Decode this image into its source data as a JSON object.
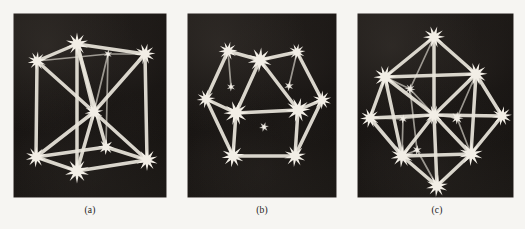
{
  "figure": {
    "background_color": "#f6f5f2",
    "panel_background_color": "#171412",
    "rod_color": "#e8e4da",
    "node_color": "#f2eee6",
    "panels": [
      {
        "id": "panel-a",
        "caption": "(a)",
        "model_name": "cube lattice model",
        "x": 14,
        "y": 14,
        "width": 152,
        "height": 183,
        "node_count": 9,
        "rod_count": 20
      },
      {
        "id": "panel-b",
        "caption": "(b)",
        "model_name": "hexagonal lattice model",
        "x": 188,
        "y": 14,
        "width": 148,
        "height": 183,
        "node_count": 12,
        "rod_count": 16
      },
      {
        "id": "panel-c",
        "caption": "(c)",
        "model_name": "face-centered cubic lattice model",
        "x": 358,
        "y": 14,
        "width": 155,
        "height": 183,
        "node_count": 13,
        "rod_count": 32
      }
    ]
  },
  "chart_data": {
    "type": "scatter",
    "title": "",
    "xlabel": "",
    "ylabel": "",
    "panels": [
      {
        "label": "(a)",
        "name": "cube lattice model",
        "xlim": [
          0,
          152
        ],
        "ylim": [
          0,
          183
        ],
        "nodes": [
          {
            "id": "n0",
            "x": 63,
            "y": 30,
            "r": 11.5
          },
          {
            "id": "n1",
            "x": 23,
            "y": 47,
            "r": 9.5
          },
          {
            "id": "n2",
            "x": 131,
            "y": 40,
            "r": 10.5
          },
          {
            "id": "n3",
            "x": 94,
            "y": 40,
            "r": 4.5
          },
          {
            "id": "n4",
            "x": 80,
            "y": 98,
            "r": 9.5
          },
          {
            "id": "n5",
            "x": 22,
            "y": 143,
            "r": 10.5
          },
          {
            "id": "n6",
            "x": 63,
            "y": 157,
            "r": 12.5
          },
          {
            "id": "n7",
            "x": 133,
            "y": 146,
            "r": 11.0
          },
          {
            "id": "n8",
            "x": 92,
            "y": 133,
            "r": 8.0
          }
        ],
        "rods": [
          [
            "n1",
            "n0"
          ],
          [
            "n0",
            "n2"
          ],
          [
            "n1",
            "n3"
          ],
          [
            "n3",
            "n2"
          ],
          [
            "n1",
            "n5"
          ],
          [
            "n0",
            "n6"
          ],
          [
            "n2",
            "n7"
          ],
          [
            "n3",
            "n8"
          ],
          [
            "n5",
            "n6"
          ],
          [
            "n6",
            "n7"
          ],
          [
            "n5",
            "n8"
          ],
          [
            "n8",
            "n7"
          ],
          [
            "n0",
            "n4"
          ],
          [
            "n4",
            "n5"
          ],
          [
            "n4",
            "n7"
          ],
          [
            "n4",
            "n6"
          ],
          [
            "n1",
            "n4"
          ],
          [
            "n2",
            "n4"
          ],
          [
            "n0",
            "n8"
          ],
          [
            "n3",
            "n4"
          ]
        ]
      },
      {
        "label": "(b)",
        "name": "hexagonal lattice model",
        "xlim": [
          0,
          148
        ],
        "ylim": [
          0,
          183
        ],
        "nodes": [
          {
            "id": "m0",
            "x": 72,
            "y": 46,
            "r": 12.5
          },
          {
            "id": "m1",
            "x": 40,
            "y": 37,
            "r": 9.5
          },
          {
            "id": "m2",
            "x": 109,
            "y": 38,
            "r": 8.5
          },
          {
            "id": "m3",
            "x": 18,
            "y": 85,
            "r": 9.5
          },
          {
            "id": "m4",
            "x": 48,
            "y": 99,
            "r": 12.5
          },
          {
            "id": "m5",
            "x": 110,
            "y": 96,
            "r": 12.5
          },
          {
            "id": "m6",
            "x": 134,
            "y": 86,
            "r": 9.5
          },
          {
            "id": "m7",
            "x": 45,
            "y": 142,
            "r": 11.5
          },
          {
            "id": "m8",
            "x": 107,
            "y": 142,
            "r": 11.0
          },
          {
            "id": "m9",
            "x": 43,
            "y": 73,
            "r": 4.5
          },
          {
            "id": "m10",
            "x": 101,
            "y": 72,
            "r": 5.0
          },
          {
            "id": "m11",
            "x": 76,
            "y": 113,
            "r": 5.0
          }
        ],
        "rods": [
          [
            "m0",
            "m4"
          ],
          [
            "m0",
            "m5"
          ],
          [
            "m4",
            "m5"
          ],
          [
            "m4",
            "m7"
          ],
          [
            "m5",
            "m8"
          ],
          [
            "m7",
            "m8"
          ],
          [
            "m1",
            "m3"
          ],
          [
            "m3",
            "m4"
          ],
          [
            "m1",
            "m0"
          ],
          [
            "m2",
            "m6"
          ],
          [
            "m6",
            "m5"
          ],
          [
            "m2",
            "m0"
          ],
          [
            "m3",
            "m7"
          ],
          [
            "m6",
            "m8"
          ],
          [
            "m1",
            "m9"
          ],
          [
            "m2",
            "m10"
          ]
        ]
      },
      {
        "label": "(c)",
        "name": "face-centered cubic lattice model",
        "xlim": [
          0,
          155
        ],
        "ylim": [
          0,
          183
        ],
        "nodes": [
          {
            "id": "p0",
            "x": 76,
            "y": 23,
            "r": 11.0
          },
          {
            "id": "p1",
            "x": 27,
            "y": 63,
            "r": 11.5
          },
          {
            "id": "p2",
            "x": 118,
            "y": 60,
            "r": 11.5
          },
          {
            "id": "p3",
            "x": 12,
            "y": 104,
            "r": 10.0
          },
          {
            "id": "p4",
            "x": 144,
            "y": 102,
            "r": 10.0
          },
          {
            "id": "p5",
            "x": 44,
            "y": 142,
            "r": 11.5
          },
          {
            "id": "p6",
            "x": 113,
            "y": 140,
            "r": 12.0
          },
          {
            "id": "p7",
            "x": 79,
            "y": 172,
            "r": 11.0
          },
          {
            "id": "p8",
            "x": 76,
            "y": 101,
            "r": 10.0
          },
          {
            "id": "p9",
            "x": 52,
            "y": 75,
            "r": 5.5
          },
          {
            "id": "p10",
            "x": 99,
            "y": 104,
            "r": 6.5
          },
          {
            "id": "p11",
            "x": 45,
            "y": 105,
            "r": 4.5
          },
          {
            "id": "p12",
            "x": 59,
            "y": 136,
            "r": 5.0
          }
        ],
        "rods": [
          [
            "p0",
            "p1"
          ],
          [
            "p0",
            "p2"
          ],
          [
            "p1",
            "p3"
          ],
          [
            "p2",
            "p4"
          ],
          [
            "p3",
            "p5"
          ],
          [
            "p4",
            "p6"
          ],
          [
            "p5",
            "p7"
          ],
          [
            "p6",
            "p7"
          ],
          [
            "p1",
            "p2"
          ],
          [
            "p5",
            "p6"
          ],
          [
            "p1",
            "p5"
          ],
          [
            "p2",
            "p6"
          ],
          [
            "p0",
            "p8"
          ],
          [
            "p8",
            "p7"
          ],
          [
            "p3",
            "p8"
          ],
          [
            "p8",
            "p4"
          ],
          [
            "p1",
            "p8"
          ],
          [
            "p2",
            "p8"
          ],
          [
            "p5",
            "p8"
          ],
          [
            "p6",
            "p8"
          ],
          [
            "p0",
            "p9"
          ],
          [
            "p9",
            "p12"
          ],
          [
            "p9",
            "p1"
          ],
          [
            "p9",
            "p8"
          ],
          [
            "p10",
            "p2"
          ],
          [
            "p10",
            "p6"
          ],
          [
            "p10",
            "p8"
          ],
          [
            "p11",
            "p3"
          ],
          [
            "p11",
            "p5"
          ],
          [
            "p12",
            "p5"
          ],
          [
            "p12",
            "p7"
          ],
          [
            "p11",
            "p8"
          ]
        ]
      }
    ]
  }
}
